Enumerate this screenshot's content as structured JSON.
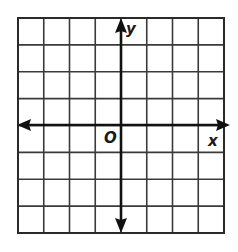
{
  "diagram": {
    "type": "coordinate-plane",
    "grid": {
      "columns": 8,
      "rows": 8,
      "left": 18,
      "top": 18,
      "right": 224,
      "bottom": 233,
      "line_color": "#3a3a3a",
      "background": "#ffffff"
    },
    "axes": {
      "color": "#111111",
      "origin_px": {
        "x": 121,
        "y": 125
      },
      "x_axis": {
        "label": "x",
        "arrows": "both"
      },
      "y_axis": {
        "label": "y",
        "arrows": "both"
      },
      "origin_label": "O"
    }
  }
}
